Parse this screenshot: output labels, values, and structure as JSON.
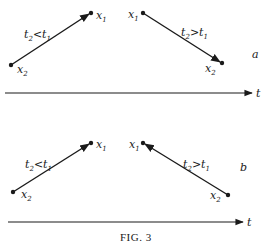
{
  "figure": {
    "caption": "FIG. 3",
    "time_axis_label": "t",
    "panels": [
      {
        "id": "a",
        "label": "a",
        "left": {
          "start": "x2",
          "end": "x1",
          "relation": "t2<t1",
          "arrow_at": "x1"
        },
        "right": {
          "start": "x1",
          "end": "x2",
          "relation": "t2>t1",
          "arrow_at": "x2"
        }
      },
      {
        "id": "b",
        "label": "b",
        "left": {
          "start": "x2",
          "end": "x1",
          "relation": "t2<t1",
          "arrow_at": "x1"
        },
        "right": {
          "start": "x2",
          "end": "x1",
          "relation": "t2>t1",
          "arrow_at": "x1"
        }
      }
    ]
  },
  "labels": {
    "x1": "x",
    "x2": "x",
    "sub1": "1",
    "sub2": "2",
    "t": "t",
    "lt": "<",
    "gt": ">",
    "a": "a",
    "b": "b"
  },
  "colors": {
    "ink": "#1a1a1a",
    "background": "#ffffff"
  }
}
